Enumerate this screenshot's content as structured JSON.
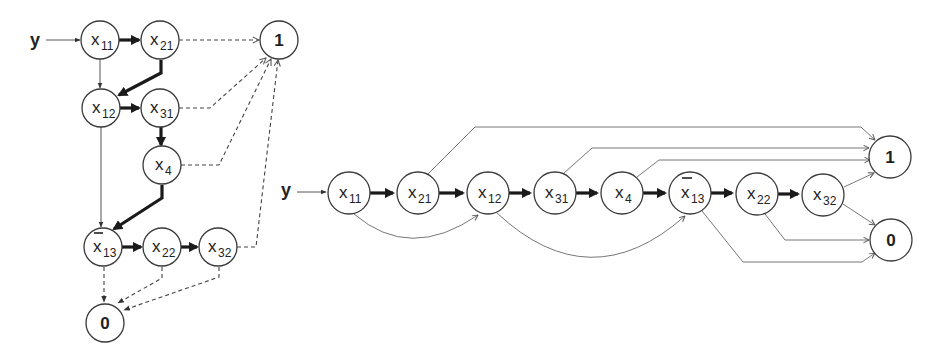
{
  "diagram": {
    "input_label": "y",
    "left": {
      "title": "BDD (tree-like layout)",
      "nodes": [
        {
          "id": "x11",
          "var": "x",
          "sub": "11",
          "negated": false,
          "cx": 100,
          "cy": 40
        },
        {
          "id": "x21",
          "var": "x",
          "sub": "21",
          "negated": false,
          "cx": 160,
          "cy": 40
        },
        {
          "id": "x12",
          "var": "x",
          "sub": "12",
          "negated": false,
          "cx": 101,
          "cy": 108
        },
        {
          "id": "x31",
          "var": "x",
          "sub": "31",
          "negated": false,
          "cx": 160,
          "cy": 108
        },
        {
          "id": "x4",
          "var": "x",
          "sub": "4",
          "negated": false,
          "cx": 162,
          "cy": 165
        },
        {
          "id": "x13",
          "var": "x",
          "sub": "13",
          "negated": true,
          "cx": 103,
          "cy": 247
        },
        {
          "id": "x22",
          "var": "x",
          "sub": "22",
          "negated": false,
          "cx": 162,
          "cy": 247
        },
        {
          "id": "x32",
          "var": "x",
          "sub": "32",
          "negated": false,
          "cx": 218,
          "cy": 247
        },
        {
          "id": "one",
          "label": "1",
          "terminal": true,
          "cx": 279,
          "cy": 40
        },
        {
          "id": "zero",
          "label": "0",
          "terminal": true,
          "cx": 105,
          "cy": 323
        }
      ],
      "edges": [
        {
          "from": "y",
          "to": "x11",
          "style": "thin"
        },
        {
          "from": "x11",
          "to": "x21",
          "style": "thick"
        },
        {
          "from": "x11",
          "to": "x12",
          "style": "thin"
        },
        {
          "from": "x21",
          "to": "x12",
          "style": "thick"
        },
        {
          "from": "x21",
          "to": "one",
          "style": "dashed"
        },
        {
          "from": "x12",
          "to": "x31",
          "style": "thick"
        },
        {
          "from": "x12",
          "to": "x13",
          "style": "thin"
        },
        {
          "from": "x31",
          "to": "x4",
          "style": "thick"
        },
        {
          "from": "x31",
          "to": "one",
          "style": "dashed"
        },
        {
          "from": "x4",
          "to": "x13",
          "style": "thick"
        },
        {
          "from": "x4",
          "to": "one",
          "style": "dashed"
        },
        {
          "from": "x13",
          "to": "x22",
          "style": "thick"
        },
        {
          "from": "x13",
          "to": "zero",
          "style": "dashed"
        },
        {
          "from": "x22",
          "to": "x32",
          "style": "thick"
        },
        {
          "from": "x22",
          "to": "zero",
          "style": "dashed"
        },
        {
          "from": "x32",
          "to": "one",
          "style": "dashed"
        },
        {
          "from": "x32",
          "to": "zero",
          "style": "dashed"
        }
      ]
    },
    "right": {
      "title": "BDD (linear chain layout)",
      "nodes": [
        {
          "id": "x11",
          "var": "x",
          "sub": "11",
          "negated": false,
          "cx": 349,
          "cy": 193
        },
        {
          "id": "x21",
          "var": "x",
          "sub": "21",
          "negated": false,
          "cx": 418,
          "cy": 193
        },
        {
          "id": "x12",
          "var": "x",
          "sub": "12",
          "negated": false,
          "cx": 488,
          "cy": 193
        },
        {
          "id": "x31",
          "var": "x",
          "sub": "31",
          "negated": false,
          "cx": 555,
          "cy": 193
        },
        {
          "id": "x4",
          "var": "x",
          "sub": "4",
          "negated": false,
          "cx": 622,
          "cy": 193
        },
        {
          "id": "x13",
          "var": "x",
          "sub": "13",
          "negated": true,
          "cx": 690,
          "cy": 193
        },
        {
          "id": "x22",
          "var": "x",
          "sub": "22",
          "negated": false,
          "cx": 757,
          "cy": 194
        },
        {
          "id": "x32",
          "var": "x",
          "sub": "32",
          "negated": false,
          "cx": 823,
          "cy": 195
        },
        {
          "id": "one",
          "label": "1",
          "terminal": true,
          "cx": 890,
          "cy": 157
        },
        {
          "id": "zero",
          "label": "0",
          "terminal": true,
          "cx": 891,
          "cy": 240
        }
      ],
      "edges": [
        {
          "from": "y",
          "to": "x11",
          "style": "thin"
        },
        {
          "from": "x11",
          "to": "x21",
          "style": "thick"
        },
        {
          "from": "x21",
          "to": "x12",
          "style": "thick"
        },
        {
          "from": "x12",
          "to": "x31",
          "style": "thick"
        },
        {
          "from": "x31",
          "to": "x4",
          "style": "thick"
        },
        {
          "from": "x4",
          "to": "x13",
          "style": "thick"
        },
        {
          "from": "x13",
          "to": "x22",
          "style": "thick"
        },
        {
          "from": "x22",
          "to": "x32",
          "style": "thick"
        },
        {
          "from": "x11",
          "to": "x12",
          "style": "thin-curved"
        },
        {
          "from": "x12",
          "to": "x13",
          "style": "thin-curved"
        },
        {
          "from": "x21",
          "to": "one",
          "style": "thin"
        },
        {
          "from": "x31",
          "to": "one",
          "style": "thin"
        },
        {
          "from": "x4",
          "to": "one",
          "style": "thin"
        },
        {
          "from": "x32",
          "to": "one",
          "style": "thin"
        },
        {
          "from": "x32",
          "to": "zero",
          "style": "thin"
        },
        {
          "from": "x22",
          "to": "zero",
          "style": "thin"
        },
        {
          "from": "x13",
          "to": "zero",
          "style": "thin"
        }
      ]
    }
  }
}
